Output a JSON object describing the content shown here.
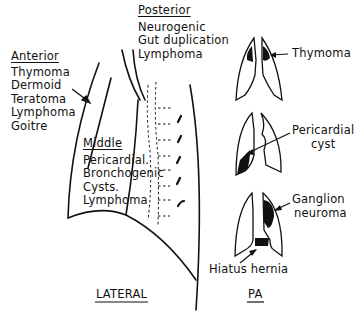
{
  "lateral_view": {
    "caption": "LATERAL",
    "anterior": {
      "heading": "Anterior",
      "items": [
        "Thymoma",
        "Dermoid",
        "Teratoma",
        "Lymphoma",
        "Goitre"
      ]
    },
    "middle": {
      "heading": "Middle",
      "items": [
        "Pericardial.",
        "Bronchogenic",
        "Cysts.",
        "Lymphoma"
      ]
    },
    "posterior": {
      "heading": "Posterior",
      "items": [
        "Neurogenic",
        "Gut duplication",
        "Lymphoma"
      ]
    }
  },
  "pa_view": {
    "caption": "PA",
    "annotations": [
      {
        "label": "Thymoma"
      },
      {
        "label_line1": "Pericardial",
        "label_line2": "cyst"
      },
      {
        "label_line1": "Ganglion",
        "label_line2": "neuroma"
      },
      {
        "label": "Hiatus hernia"
      }
    ]
  },
  "colors": {
    "ink": "#111111",
    "background": "#ffffff"
  }
}
